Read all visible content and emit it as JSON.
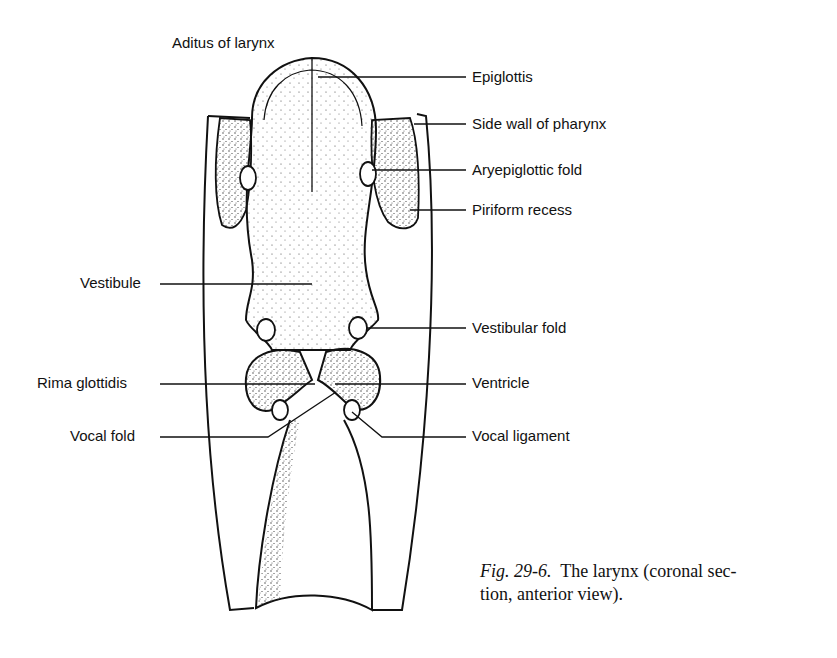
{
  "figure": {
    "number": "Fig. 29-6.",
    "caption_line1": "The larynx (coronal sec-",
    "caption_line2": "tion, anterior view)."
  },
  "labels": {
    "aditus": "Aditus of larynx",
    "epiglottis": "Epiglottis",
    "side_wall": "Side wall of pharynx",
    "aryepiglottic": "Aryepiglottic fold",
    "piriform": "Piriform recess",
    "vestibule": "Vestibule",
    "vestibular_fold": "Vestibular fold",
    "rima": "Rima glottidis",
    "ventricle": "Ventricle",
    "vocal_fold": "Vocal fold",
    "vocal_ligament": "Vocal ligament"
  }
}
